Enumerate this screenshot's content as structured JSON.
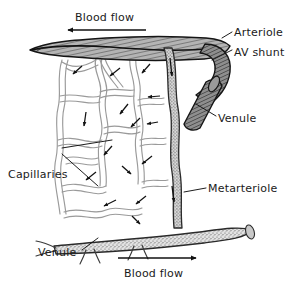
{
  "figure": {
    "background_color": "#ffffff",
    "ink_color": "#1a1a1a",
    "capillary_color": "#9a9a9a",
    "vessel_fill_gray": "#b0b0b0",
    "vessel_fill_dark": "#8a8a8a",
    "stipple_color": "#7a7a7a"
  },
  "labels": {
    "blood_flow_top": "Blood flow",
    "blood_flow_bottom": "Blood flow",
    "arteriole": "Arteriole",
    "av_shunt": "AV shunt",
    "venule_right": "Venule",
    "venule_bottom": "Venule",
    "capillaries": "Capillaries",
    "metarteriole": "Metarteriole"
  },
  "structures": [
    {
      "name": "arteriole",
      "label": "Arteriole",
      "type": "vessel",
      "orientation": "horizontal-top",
      "shading": "hatched"
    },
    {
      "name": "av-shunt",
      "label": "AV shunt",
      "type": "vessel",
      "orientation": "curved-right",
      "shading": "dark-hatched"
    },
    {
      "name": "venule-right",
      "label": "Venule",
      "type": "vessel",
      "orientation": "diagonal-cylinder",
      "shading": "dark-hatched"
    },
    {
      "name": "metarteriole",
      "label": "Metarteriole",
      "type": "vessel",
      "orientation": "vertical",
      "shading": "stippled"
    },
    {
      "name": "venule-bottom",
      "label": "Venule",
      "type": "vessel",
      "orientation": "horizontal-bottom",
      "shading": "stippled"
    },
    {
      "name": "capillary-network",
      "label": "Capillaries",
      "type": "network",
      "orientation": "mesh",
      "shading": "outline"
    }
  ],
  "flow_arrows": {
    "top_direction": "left",
    "bottom_direction": "right",
    "network_count": 14
  }
}
